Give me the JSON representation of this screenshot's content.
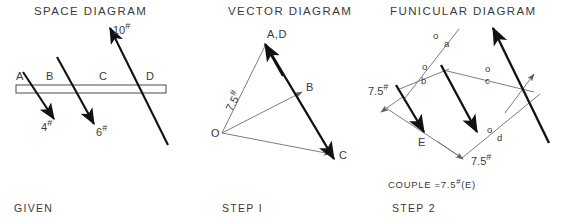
{
  "figure": {
    "panels": [
      {
        "id": "space",
        "title": "SPACE DIAGRAM",
        "caption": "GIVEN",
        "beam_interval_labels": [
          "A",
          "B",
          "C",
          "D"
        ],
        "loads": [
          {
            "label": "4",
            "unit": "#",
            "direction": "down-right"
          },
          {
            "label": "6",
            "unit": "#",
            "direction": "down-right"
          },
          {
            "label": "10",
            "unit": "#",
            "direction": "up-right"
          }
        ]
      },
      {
        "id": "vector",
        "title": "VECTOR DIAGRAM",
        "caption": "STEP I",
        "vertices": [
          "A,D",
          "B",
          "C",
          "O"
        ],
        "pole_label": "O",
        "resultant": {
          "label": "7.5",
          "unit": "#"
        }
      },
      {
        "id": "funicular",
        "title": "FUNICULAR DIAGRAM",
        "caption": "STEP 2",
        "rays": [
          {
            "upper": "o",
            "lower": "a"
          },
          {
            "upper": "o",
            "lower": "b"
          },
          {
            "upper": "o",
            "lower": "c"
          },
          {
            "upper": "o",
            "lower": "d"
          }
        ],
        "couple_forces": [
          {
            "label": "7.5",
            "unit": "#",
            "position": "left"
          },
          {
            "label": "7.5",
            "unit": "#",
            "position": "bottom"
          }
        ],
        "arm_label": "E",
        "couple_result": {
          "prefix": "COUPLE =",
          "magnitude": "7.5",
          "unit": "#",
          "suffix": "(E)"
        }
      }
    ]
  },
  "colors": {
    "ink": "#2b2b2b",
    "thin_line": "#6e6e6e",
    "thick_line": "#111111",
    "background": "#ffffff"
  }
}
